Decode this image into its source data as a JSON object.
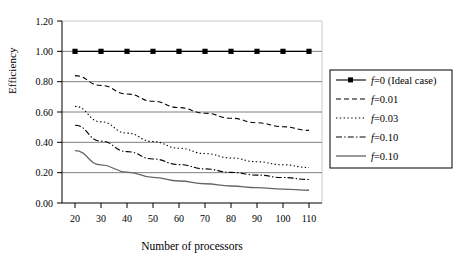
{
  "chart_data": {
    "type": "line",
    "title": "",
    "subtitle": "",
    "xlabel": "Number of processors",
    "ylabel": "Efficiency",
    "x": [
      20,
      30,
      40,
      50,
      60,
      70,
      80,
      90,
      100,
      110
    ],
    "xlim": [
      15,
      115
    ],
    "ylim": [
      0.0,
      1.2
    ],
    "xticks": [
      20,
      30,
      40,
      50,
      60,
      70,
      80,
      90,
      100,
      110
    ],
    "yticks": [
      0.0,
      0.2,
      0.4,
      0.6,
      0.8,
      1.0,
      1.2
    ],
    "xtick_labels": [
      "20",
      "30",
      "40",
      "50",
      "60",
      "70",
      "80",
      "90",
      "100",
      "110"
    ],
    "ytick_labels": [
      "0.00",
      "0.20",
      "0.40",
      "0.60",
      "0.80",
      "1.00",
      "1.20"
    ],
    "grid": "horizontal",
    "legend_position": "right-outside",
    "note": "Efficiency follows Amdahl's law E = 1/(1 + f*(p-1))",
    "series": [
      {
        "name": "f=0 (Ideal case)",
        "f": 0,
        "style": "solid-with-markers",
        "marker": "square",
        "color": "#000000",
        "values": [
          1.0,
          1.0,
          1.0,
          1.0,
          1.0,
          1.0,
          1.0,
          1.0,
          1.0,
          1.0
        ]
      },
      {
        "name": "f=0.01",
        "f": 0.01,
        "style": "dashed",
        "marker": "none",
        "color": "#000000",
        "values": [
          0.84,
          0.775,
          0.719,
          0.671,
          0.629,
          0.592,
          0.559,
          0.529,
          0.503,
          0.479
        ]
      },
      {
        "name": "f=0.03",
        "f": 0.03,
        "style": "dotted",
        "marker": "none",
        "color": "#000000",
        "values": [
          0.637,
          0.535,
          0.461,
          0.405,
          0.361,
          0.326,
          0.297,
          0.272,
          0.252,
          0.234
        ]
      },
      {
        "name": "f=0.05",
        "f": 0.05,
        "style": "dash-dot",
        "marker": "none",
        "color": "#000000",
        "values": [
          0.513,
          0.408,
          0.339,
          0.29,
          0.253,
          0.225,
          0.202,
          0.184,
          0.168,
          0.155
        ]
      },
      {
        "name": "f=0.10",
        "f": 0.1,
        "style": "solid",
        "marker": "none",
        "color": "#000000",
        "values": [
          0.345,
          0.251,
          0.204,
          0.169,
          0.145,
          0.127,
          0.112,
          0.101,
          0.092,
          0.084
        ]
      }
    ]
  },
  "legend": {
    "entries": [
      {
        "label": "f=0 (Ideal case)",
        "f_prefix": "f",
        "rest": "=0 (Ideal case)"
      },
      {
        "label": "f=0.01",
        "f_prefix": "f",
        "rest": "=0.01"
      },
      {
        "label": "f=0.03",
        "f_prefix": "f",
        "rest": "=0.03"
      },
      {
        "label": "f=0.05",
        "f_prefix": "f",
        "rest": "=0.05"
      },
      {
        "label": "f=0.10",
        "f_prefix": "f",
        "rest": "=0.10"
      }
    ]
  },
  "colors": {
    "line": "#000000",
    "grid": "#808080",
    "axis": "#000000",
    "plot_border": "#c8c8c8",
    "background": "#ffffff"
  }
}
